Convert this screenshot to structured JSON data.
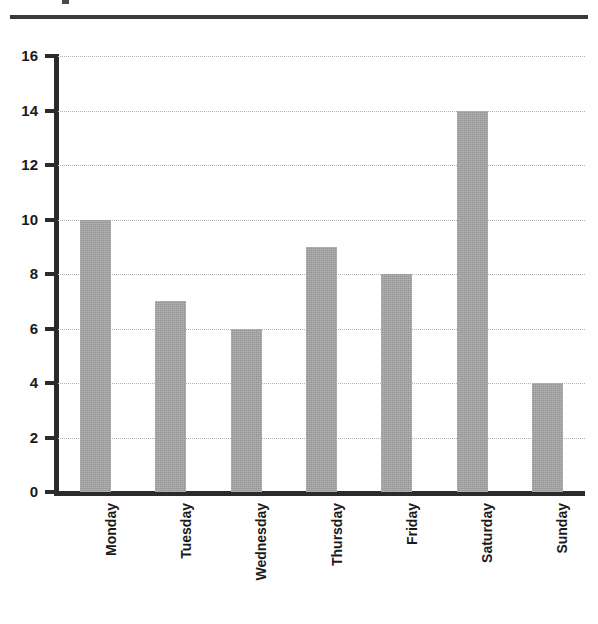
{
  "figure": {
    "has_top_rule": true,
    "background_color": "#ffffff",
    "bar_color": "#a3a3a3",
    "axis_color": "#2b2b2b",
    "gridline_color": "#b4b4b4"
  },
  "chart_data": {
    "type": "bar",
    "title": "",
    "subtitle": "",
    "xlabel": "",
    "ylabel": "",
    "categories": [
      "Monday",
      "Tuesday",
      "Wednesday",
      "Thursday",
      "Friday",
      "Saturday",
      "Sunday"
    ],
    "values": [
      10,
      7,
      6,
      9,
      8,
      14,
      4
    ],
    "ylim": [
      0,
      16
    ],
    "y_ticks": [
      0,
      2,
      4,
      6,
      8,
      10,
      12,
      14,
      16
    ],
    "y_tick_labels": [
      "0",
      "2",
      "4",
      "6",
      "8",
      "10",
      "12",
      "14",
      "16"
    ],
    "grid": true,
    "grid_axis": "y",
    "grid_style": "dotted",
    "legend": false,
    "legend_position": "none",
    "x_tick_label_rotation": 90,
    "annotations": []
  }
}
